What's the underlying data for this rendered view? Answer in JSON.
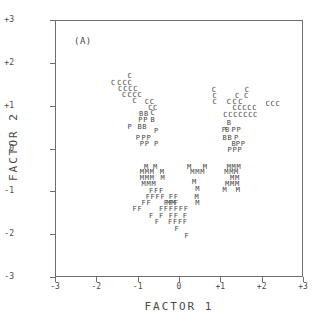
{
  "chart_data": {
    "type": "scatter",
    "title": "",
    "panel_label": "(A)",
    "xlabel": "FACTOR 1",
    "ylabel": "FACTOR 2",
    "xlim": [
      -3,
      3
    ],
    "ylim": [
      -3,
      3
    ],
    "grid": false,
    "legend": "none",
    "xticks": [
      "-3",
      "-2",
      "-1",
      "0",
      "+1",
      "+2",
      "+3"
    ],
    "xtick_values": [
      -3,
      -2,
      -1,
      0,
      1,
      2,
      3
    ],
    "yticks": [
      "+3",
      "+2",
      "+1",
      "0",
      "-1",
      "-2",
      "-3"
    ],
    "ytick_values": [
      3,
      2,
      1,
      0,
      -1,
      -2,
      -3
    ],
    "marker_style": "text-glyph",
    "series": [
      {
        "name": "C",
        "glyph": "C",
        "points": [
          [
            -1.22,
            1.72
          ],
          [
            -1.62,
            1.55
          ],
          [
            -1.47,
            1.55
          ],
          [
            -1.34,
            1.55
          ],
          [
            -1.22,
            1.55
          ],
          [
            -1.45,
            1.42
          ],
          [
            -1.32,
            1.42
          ],
          [
            -1.2,
            1.42
          ],
          [
            -1.08,
            1.42
          ],
          [
            -1.35,
            1.28
          ],
          [
            -1.22,
            1.28
          ],
          [
            -1.1,
            1.28
          ],
          [
            -0.98,
            1.28
          ],
          [
            -1.1,
            1.14
          ],
          [
            -0.8,
            1.12
          ],
          [
            -0.68,
            1.12
          ],
          [
            -0.72,
            0.98
          ],
          [
            -0.6,
            0.98
          ],
          [
            -0.66,
            0.86
          ],
          [
            0.82,
            1.38
          ],
          [
            1.62,
            1.4
          ],
          [
            0.84,
            1.24
          ],
          [
            1.38,
            1.26
          ],
          [
            1.6,
            1.24
          ],
          [
            0.84,
            1.1
          ],
          [
            1.18,
            1.1
          ],
          [
            1.32,
            1.1
          ],
          [
            1.46,
            1.1
          ],
          [
            2.12,
            1.06
          ],
          [
            2.24,
            1.06
          ],
          [
            2.36,
            1.06
          ],
          [
            1.32,
            0.96
          ],
          [
            1.44,
            0.96
          ],
          [
            1.56,
            0.96
          ],
          [
            1.68,
            0.96
          ],
          [
            1.8,
            0.96
          ],
          [
            1.1,
            0.8
          ],
          [
            1.22,
            0.8
          ],
          [
            1.34,
            0.8
          ],
          [
            1.46,
            0.8
          ],
          [
            1.58,
            0.8
          ],
          [
            1.7,
            0.8
          ],
          [
            1.82,
            0.8
          ]
        ]
      },
      {
        "name": "B",
        "glyph": "B",
        "points": [
          [
            -0.94,
            0.84
          ],
          [
            -0.82,
            0.84
          ],
          [
            -0.66,
            0.7
          ],
          [
            -0.98,
            0.52
          ],
          [
            -0.86,
            0.52
          ],
          [
            1.18,
            0.62
          ],
          [
            1.14,
            0.46
          ],
          [
            1.08,
            0.28
          ],
          [
            1.2,
            0.28
          ],
          [
            1.3,
            0.12
          ]
        ]
      },
      {
        "name": "P",
        "glyph": "P",
        "points": [
          [
            -0.96,
            0.7
          ],
          [
            -0.84,
            0.7
          ],
          [
            -1.22,
            0.52
          ],
          [
            -0.58,
            0.44
          ],
          [
            -1.02,
            0.26
          ],
          [
            -0.88,
            0.26
          ],
          [
            -0.76,
            0.26
          ],
          [
            -0.92,
            0.12
          ],
          [
            -0.8,
            0.12
          ],
          [
            -0.58,
            0.12
          ],
          [
            1.06,
            0.46
          ],
          [
            1.3,
            0.46
          ],
          [
            1.42,
            0.46
          ],
          [
            1.36,
            0.28
          ],
          [
            1.4,
            0.12
          ],
          [
            1.52,
            0.12
          ],
          [
            1.2,
            -0.02
          ],
          [
            1.32,
            -0.02
          ],
          [
            1.44,
            -0.02
          ]
        ]
      },
      {
        "name": "M",
        "glyph": "M",
        "points": [
          [
            -0.82,
            -0.4
          ],
          [
            -0.6,
            -0.4
          ],
          [
            -0.92,
            -0.52
          ],
          [
            -0.8,
            -0.52
          ],
          [
            -0.68,
            -0.52
          ],
          [
            -0.44,
            -0.52
          ],
          [
            -0.92,
            -0.66
          ],
          [
            -0.8,
            -0.66
          ],
          [
            -0.68,
            -0.66
          ],
          [
            -0.42,
            -0.66
          ],
          [
            -0.88,
            -0.8
          ],
          [
            -0.76,
            -0.8
          ],
          [
            -0.64,
            -0.8
          ],
          [
            -0.28,
            -1.26
          ],
          [
            -0.16,
            -1.26
          ],
          [
            0.3,
            -0.52
          ],
          [
            0.42,
            -0.52
          ],
          [
            0.54,
            -0.52
          ],
          [
            0.22,
            -0.4
          ],
          [
            0.34,
            -0.76
          ],
          [
            0.42,
            -0.92
          ],
          [
            0.4,
            -1.1
          ],
          [
            0.42,
            -1.26
          ],
          [
            0.6,
            -0.4
          ],
          [
            1.18,
            -0.4
          ],
          [
            1.3,
            -0.4
          ],
          [
            1.42,
            -0.4
          ],
          [
            1.12,
            -0.52
          ],
          [
            1.24,
            -0.52
          ],
          [
            1.36,
            -0.52
          ],
          [
            1.26,
            -0.66
          ],
          [
            1.38,
            -0.66
          ],
          [
            1.14,
            -0.8
          ],
          [
            1.26,
            -0.8
          ],
          [
            1.38,
            -0.8
          ],
          [
            1.08,
            -0.94
          ],
          [
            1.4,
            -0.94
          ]
        ]
      },
      {
        "name": "F",
        "glyph": "F",
        "points": [
          [
            -0.7,
            -0.98
          ],
          [
            -0.58,
            -0.98
          ],
          [
            -0.46,
            -0.98
          ],
          [
            -0.78,
            -1.12
          ],
          [
            -0.66,
            -1.12
          ],
          [
            -0.54,
            -1.12
          ],
          [
            -0.42,
            -1.12
          ],
          [
            -0.22,
            -1.12
          ],
          [
            -0.1,
            -1.12
          ],
          [
            -0.88,
            -1.26
          ],
          [
            -0.76,
            -1.26
          ],
          [
            -0.34,
            -1.26
          ],
          [
            -0.22,
            -1.26
          ],
          [
            -0.1,
            -1.26
          ],
          [
            -1.1,
            -1.4
          ],
          [
            -0.98,
            -1.4
          ],
          [
            -0.46,
            -1.4
          ],
          [
            -0.34,
            -1.4
          ],
          [
            -0.22,
            -1.4
          ],
          [
            -0.1,
            -1.4
          ],
          [
            0.02,
            -1.4
          ],
          [
            0.14,
            -1.4
          ],
          [
            -0.7,
            -1.56
          ],
          [
            -0.46,
            -1.56
          ],
          [
            -0.22,
            -1.56
          ],
          [
            -0.1,
            -1.56
          ],
          [
            0.12,
            -1.56
          ],
          [
            -0.56,
            -1.7
          ],
          [
            -0.24,
            -1.7
          ],
          [
            -0.12,
            -1.7
          ],
          [
            0.0,
            -1.7
          ],
          [
            0.12,
            -1.7
          ],
          [
            -0.08,
            -1.86
          ],
          [
            0.16,
            -2.02
          ]
        ]
      }
    ]
  }
}
